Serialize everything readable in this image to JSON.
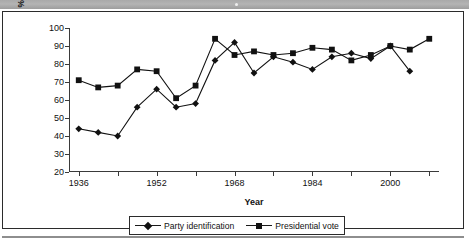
{
  "figure": {
    "top_band": "decorative-gray-band",
    "bottom_rule": "decorative-hairline"
  },
  "chart_data": {
    "type": "line",
    "title": "",
    "xlabel": "Year",
    "ylabel": "% Voting/identifying Democratic",
    "ylabel_line1": "% Voting/identifying",
    "ylabel_line2": "Democratic",
    "grid": false,
    "legend_position": "bottom-center",
    "xlim": [
      1934,
      2010
    ],
    "ylim": [
      20,
      100
    ],
    "ytick_labels": [
      "100",
      "90",
      "80",
      "70",
      "60",
      "50",
      "40",
      "30",
      "20"
    ],
    "ytick_values": [
      100,
      90,
      80,
      70,
      60,
      50,
      40,
      30,
      20
    ],
    "xtick_labels": [
      "1936",
      "1952",
      "1968",
      "1984",
      "2000"
    ],
    "xtick_label_values": [
      1936,
      1952,
      1968,
      1984,
      2000
    ],
    "xtick_minor_values": [
      1944,
      1960,
      1976,
      1992,
      2008
    ],
    "x": [
      1936,
      1940,
      1944,
      1948,
      1952,
      1956,
      1960,
      1964,
      1968,
      1972,
      1976,
      1980,
      1984,
      1988,
      1992,
      1996,
      2000,
      2004,
      2008
    ],
    "series": [
      {
        "name": "Party identification",
        "marker": "diamond",
        "color": "#111111",
        "x": [
          1936,
          1940,
          1944,
          1948,
          1952,
          1956,
          1960,
          1964,
          1968,
          1972,
          1976,
          1980,
          1984,
          1988,
          1992,
          1996,
          2000,
          2004
        ],
        "values": [
          44,
          42,
          40,
          56,
          66,
          56,
          58,
          82,
          92,
          75,
          84,
          81,
          77,
          84,
          86,
          83,
          90,
          76
        ]
      },
      {
        "name": "Presidential vote",
        "marker": "square",
        "color": "#111111",
        "x": [
          1936,
          1940,
          1944,
          1948,
          1952,
          1956,
          1960,
          1964,
          1968,
          1972,
          1976,
          1980,
          1984,
          1988,
          1992,
          1996,
          2000,
          2004,
          2008
        ],
        "values": [
          71,
          67,
          68,
          77,
          76,
          61,
          68,
          94,
          85,
          87,
          85,
          86,
          89,
          88,
          82,
          85,
          90,
          88,
          94
        ]
      }
    ]
  },
  "legend": {
    "items": [
      {
        "label": "Party identification",
        "marker": "diamond"
      },
      {
        "label": "Presidential vote",
        "marker": "square"
      }
    ]
  }
}
